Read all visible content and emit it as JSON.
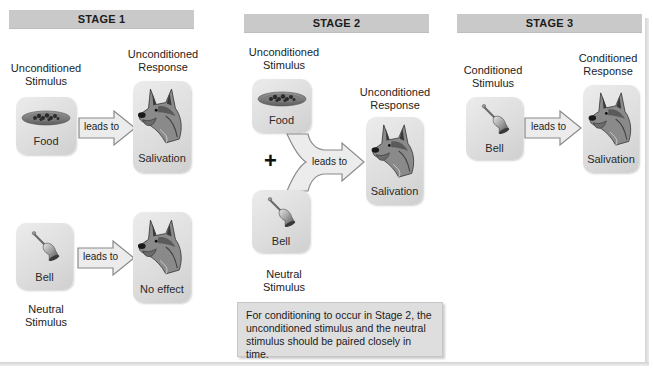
{
  "stages": [
    {
      "header": "STAGE 1",
      "rows": [
        {
          "stimulus_label": [
            "Unconditioned",
            "Stimulus"
          ],
          "stimulus_item": "Food",
          "arrow_label": "leads to",
          "response_label": [
            "Unconditioned",
            "Response"
          ],
          "response_item": "Salivation"
        },
        {
          "stimulus_label": [
            "Neutral",
            "Stimulus"
          ],
          "stimulus_item": "Bell",
          "arrow_label": "leads to",
          "response_item": "No effect"
        }
      ]
    },
    {
      "header": "STAGE 2",
      "stimulus_top_label": [
        "Unconditioned",
        "Stimulus"
      ],
      "stimulus_top_item": "Food",
      "plus_sign": "+",
      "stimulus_bottom_item": "Bell",
      "stimulus_bottom_label": [
        "Neutral",
        "Stimulus"
      ],
      "arrow_label": "leads to",
      "response_label": [
        "Unconditioned",
        "Response"
      ],
      "response_item": "Salivation",
      "note": [
        "For conditioning to occur in Stage 2, the",
        "unconditioned stimulus and the neutral",
        "stimulus should be paired closely in time."
      ]
    },
    {
      "header": "STAGE 3",
      "stimulus_label": [
        "Conditioned",
        "Stimulus"
      ],
      "stimulus_item": "Bell",
      "arrow_label": "leads to",
      "response_label": [
        "Conditioned",
        "Response"
      ],
      "response_item": "Salivation"
    }
  ],
  "icons": {
    "food": "food-bowl-icon",
    "bell": "bell-icon",
    "dog": "dog-head-icon"
  },
  "colors": {
    "header_bg": "#c9c9c9",
    "tile_bg": "#dcdcdc",
    "note_bg": "#dedede",
    "arrow_fill": "#ececec",
    "arrow_stroke": "#8a8a8a"
  }
}
